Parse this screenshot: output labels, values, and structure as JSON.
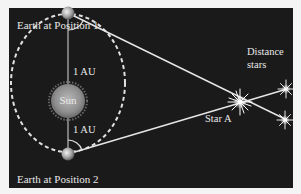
{
  "diagram": {
    "labels": {
      "earth1": "Earth at Position 1",
      "earth2": "Earth at Position 2",
      "sun": "Sun",
      "au_top": "1 AU",
      "au_bottom": "1 AU",
      "star_a": "Star A",
      "distant_line1": "Distance",
      "distant_line2": "stars"
    },
    "colors": {
      "panel": "#1a1a1a",
      "border": "#f4f4f4",
      "lines": "#e6e6e6",
      "sun": "#9a9a9a",
      "text": "#e8e8e8"
    }
  }
}
